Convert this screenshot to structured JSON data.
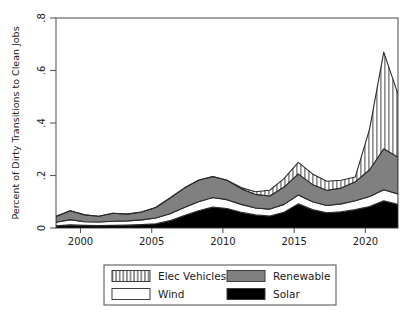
{
  "chart_data": {
    "type": "area",
    "stacked": true,
    "title": "",
    "xlabel": "",
    "ylabel": "Percent of Dirty Transitions to Clean Jobs",
    "xlim": [
      1998,
      2022
    ],
    "ylim": [
      0,
      0.8
    ],
    "yticks": [
      0,
      0.2,
      0.4,
      0.6,
      0.8
    ],
    "ytick_labels": [
      "0",
      ".2",
      ".4",
      ".6",
      ".8"
    ],
    "xticks": [
      2000,
      2005,
      2010,
      2015,
      2020
    ],
    "xtick_labels": [
      "2000",
      "2005",
      "2010",
      "2015",
      "2020"
    ],
    "grid": false,
    "legend_position": "below-center",
    "x": [
      1998,
      1999,
      2000,
      2001,
      2002,
      2003,
      2004,
      2005,
      2006,
      2007,
      2008,
      2009,
      2010,
      2011,
      2012,
      2013,
      2014,
      2015,
      2016,
      2017,
      2018,
      2019,
      2020,
      2021,
      2022
    ],
    "series": [
      {
        "name": "Solar",
        "fill": "#000000",
        "pattern": "solid-black",
        "values": [
          0.008,
          0.012,
          0.01,
          0.009,
          0.01,
          0.011,
          0.013,
          0.016,
          0.028,
          0.048,
          0.066,
          0.08,
          0.074,
          0.06,
          0.05,
          0.046,
          0.06,
          0.092,
          0.07,
          0.058,
          0.062,
          0.07,
          0.082,
          0.104,
          0.09
        ]
      },
      {
        "name": "Wind",
        "fill": "#ffffff",
        "pattern": "solid-white",
        "values": [
          0.014,
          0.02,
          0.014,
          0.014,
          0.016,
          0.016,
          0.018,
          0.022,
          0.026,
          0.03,
          0.034,
          0.036,
          0.034,
          0.03,
          0.026,
          0.026,
          0.03,
          0.034,
          0.03,
          0.028,
          0.03,
          0.034,
          0.038,
          0.042,
          0.04
        ]
      },
      {
        "name": "Renewable",
        "fill": "#808080",
        "pattern": "solid-gray",
        "values": [
          0.022,
          0.034,
          0.026,
          0.022,
          0.03,
          0.026,
          0.03,
          0.04,
          0.06,
          0.074,
          0.082,
          0.08,
          0.074,
          0.06,
          0.052,
          0.05,
          0.066,
          0.08,
          0.066,
          0.058,
          0.06,
          0.072,
          0.102,
          0.156,
          0.14
        ]
      },
      {
        "name": "Elec Vehicles",
        "fill": "#ffffff",
        "pattern": "vertical-hatch",
        "values": [
          0.0,
          0.0,
          0.0,
          0.0,
          0.0,
          0.0,
          0.0,
          0.0,
          0.0,
          0.0,
          0.0,
          0.0,
          0.0,
          0.004,
          0.01,
          0.022,
          0.032,
          0.044,
          0.04,
          0.034,
          0.03,
          0.018,
          0.154,
          0.368,
          0.24
        ]
      }
    ]
  },
  "legend": {
    "items": [
      {
        "label": "Elec Vehicles",
        "swatch": "vertical-hatch"
      },
      {
        "label": "Renewable",
        "swatch": "solid-gray"
      },
      {
        "label": "Wind",
        "swatch": "solid-white"
      },
      {
        "label": "Solar",
        "swatch": "solid-black"
      }
    ]
  },
  "colors": {
    "solar": "#000000",
    "wind": "#ffffff",
    "renewable": "#808080",
    "elec_vehicles": "#ffffff",
    "axis": "#4d4d4d",
    "text": "#1a1a1a",
    "background": "#ffffff"
  }
}
